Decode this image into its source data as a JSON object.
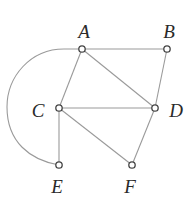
{
  "diagram": {
    "type": "graph",
    "nodes": [
      {
        "id": "A",
        "label": "A",
        "x": 82,
        "y": 49,
        "label_x": 84,
        "label_y": 31
      },
      {
        "id": "B",
        "label": "B",
        "x": 167,
        "y": 49,
        "label_x": 169,
        "label_y": 31
      },
      {
        "id": "C",
        "label": "C",
        "x": 59,
        "y": 108,
        "label_x": 38,
        "label_y": 110
      },
      {
        "id": "D",
        "label": "D",
        "x": 155,
        "y": 108,
        "label_x": 176,
        "label_y": 110
      },
      {
        "id": "E",
        "label": "E",
        "x": 59,
        "y": 165,
        "label_x": 57,
        "label_y": 186
      },
      {
        "id": "F",
        "label": "F",
        "x": 132,
        "y": 165,
        "label_x": 130,
        "label_y": 186
      }
    ],
    "edges": [
      {
        "from": "A",
        "to": "B",
        "shape": "line"
      },
      {
        "from": "A",
        "to": "C",
        "shape": "line"
      },
      {
        "from": "A",
        "to": "D",
        "shape": "line"
      },
      {
        "from": "B",
        "to": "D",
        "shape": "line"
      },
      {
        "from": "C",
        "to": "D",
        "shape": "line"
      },
      {
        "from": "C",
        "to": "E",
        "shape": "line"
      },
      {
        "from": "C",
        "to": "F",
        "shape": "line"
      },
      {
        "from": "D",
        "to": "F",
        "shape": "line"
      },
      {
        "from": "A",
        "to": "E",
        "shape": "arc"
      }
    ],
    "colors": {
      "edge": "#9a9a9a",
      "node_stroke": "#444444",
      "node_fill": "#ffffff",
      "label": "#2a2a2a"
    }
  }
}
